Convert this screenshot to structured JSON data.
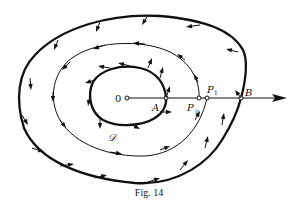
{
  "figure": {
    "caption": "Fig. 14",
    "labels": {
      "origin": "0",
      "point_a": "A",
      "point_p0_main": "P",
      "point_p0_sub": "0",
      "point_p1_main": "P",
      "point_p1_sub": "1",
      "point_b": "B",
      "region": "𝒟"
    },
    "colors": {
      "ink": "#111111",
      "background": "#ffffff"
    }
  }
}
